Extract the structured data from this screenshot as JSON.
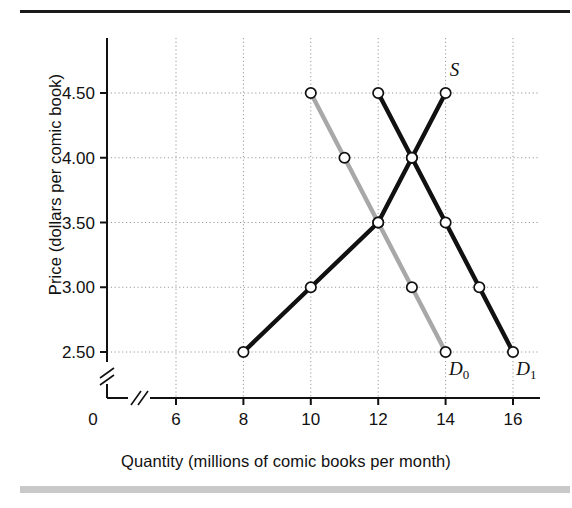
{
  "figure": {
    "y_axis_title": "Price (dollars per comic book)",
    "x_axis_title": "Quantity (millions of comic books per month)",
    "origin_label": "0"
  },
  "chart_data": {
    "type": "line",
    "title": "",
    "xlabel": "Quantity (millions of comic books per month)",
    "ylabel": "Price (dollars per comic book)",
    "xlim": [
      5.2,
      16.6
    ],
    "ylim": [
      2.3,
      4.72
    ],
    "x_ticks": [
      "6",
      "8",
      "10",
      "12",
      "14",
      "16"
    ],
    "x_tick_values": [
      6,
      8,
      10,
      12,
      14,
      16
    ],
    "y_ticks": [
      "2.50",
      "3.00",
      "3.50",
      "4.00",
      "4.50"
    ],
    "y_tick_values": [
      2.5,
      3.0,
      3.5,
      4.0,
      4.5
    ],
    "grid": true,
    "axis_break_x": true,
    "axis_break_y": true,
    "legend": "inline-labels",
    "series": [
      {
        "name": "S",
        "label": "S",
        "sublabel": "",
        "role": "supply",
        "color": "#111111",
        "x": [
          8,
          10,
          12,
          13,
          14
        ],
        "y": [
          2.5,
          3.0,
          3.5,
          4.0,
          4.5
        ],
        "label_x": 14.12,
        "label_y": 4.63
      },
      {
        "name": "D0",
        "label": "D",
        "sublabel": "0",
        "role": "demand-original",
        "color": "#a8a8a8",
        "x": [
          10,
          11,
          12,
          13,
          14
        ],
        "y": [
          4.5,
          4.0,
          3.5,
          3.0,
          2.5
        ],
        "label_x": 14.1,
        "label_y": 2.32
      },
      {
        "name": "D1",
        "label": "D",
        "sublabel": "1",
        "role": "demand-new",
        "color": "#111111",
        "x": [
          12,
          13,
          14,
          15,
          16
        ],
        "y": [
          4.5,
          4.0,
          3.5,
          3.0,
          2.5
        ],
        "label_x": 16.1,
        "label_y": 2.32
      }
    ],
    "equilibrium_original": {
      "quantity": 12,
      "price": 3.5
    },
    "equilibrium_new": {
      "quantity": 13,
      "price": 4.0
    }
  }
}
